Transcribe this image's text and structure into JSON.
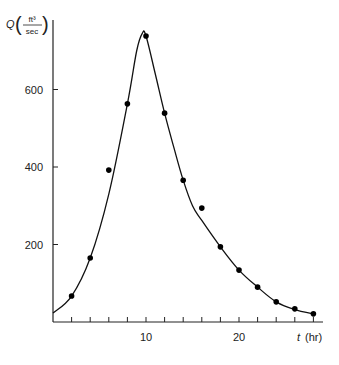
{
  "chart_data": {
    "type": "line",
    "title": "",
    "xlabel": "t (hr)",
    "ylabel": "Q (ft³/sec)",
    "ylabel_parts": {
      "symbol": "Q",
      "num": "ft³",
      "den": "sec"
    },
    "xlabel_parts": {
      "symbol": "t",
      "unit": "(hr)"
    },
    "xlim": [
      0,
      29
    ],
    "ylim": [
      0,
      770
    ],
    "x_ticks": [
      2,
      4,
      6,
      8,
      10,
      12,
      14,
      16,
      18,
      20,
      22,
      24,
      26,
      28
    ],
    "x_tick_labels": [
      {
        "value": 10,
        "label": "10"
      },
      {
        "value": 20,
        "label": "20"
      }
    ],
    "y_ticks": [
      200,
      400,
      600
    ],
    "y_tick_labels": [
      {
        "value": 200,
        "label": "200"
      },
      {
        "value": 400,
        "label": "400"
      },
      {
        "value": 600,
        "label": "600"
      }
    ],
    "grid": false,
    "legend": null,
    "series": [
      {
        "name": "observed",
        "style": "scatter",
        "x": [
          2,
          4,
          6,
          8,
          10,
          12,
          14,
          16,
          18,
          20,
          22,
          24,
          26,
          28
        ],
        "y": [
          67,
          165,
          392,
          563,
          738,
          539,
          366,
          294,
          194,
          134,
          90,
          52,
          34,
          21
        ]
      },
      {
        "name": "fitted hydrograph",
        "style": "line",
        "x": [
          0,
          2,
          4,
          6,
          8,
          9,
          9.6,
          10,
          11,
          12,
          13,
          14,
          15,
          16,
          18,
          20,
          22,
          24,
          26,
          28
        ],
        "y": [
          23,
          67,
          165,
          330,
          563,
          700,
          745,
          738,
          640,
          539,
          450,
          366,
          300,
          262,
          194,
          134,
          90,
          52,
          32,
          21
        ]
      }
    ]
  }
}
